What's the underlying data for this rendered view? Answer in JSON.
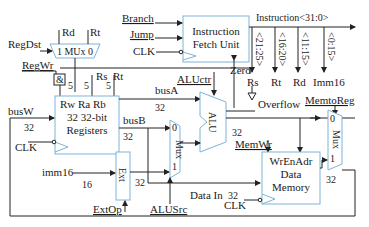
{
  "diagram": {
    "type": "single-cycle MIPS datapath",
    "blocks": {
      "ifu": {
        "line1": "Instruction",
        "line2": "Fetch Unit"
      },
      "regdst_mux": {
        "label": "1 MUx 0"
      },
      "registers": {
        "ports": "Rw  Ra Rb",
        "line1": "32 32-bit",
        "line2": "Registers"
      },
      "alu": {
        "label": "ALU"
      },
      "alusrc_mux": {
        "label": "Mux",
        "in0": "0",
        "in1": "1"
      },
      "ext": {
        "label": "Ext"
      },
      "data_memory": {
        "line1": "WrEnAdr",
        "line2": "Data",
        "line3": "Memory"
      },
      "memtoreg_mux": {
        "label": "Mux",
        "in0": "0",
        "in1": "1"
      },
      "and_gate": {
        "label": "&"
      }
    },
    "control_signals": {
      "branch": "Branch",
      "jump": "Jump",
      "regdst": "RegDst",
      "regwr": "RegWr",
      "aluctr": "ALUctr",
      "memwr": "MemWr",
      "memtoreg": "MemtoReg",
      "alusrc": "ALUSrc",
      "extop": "ExtOp"
    },
    "signals": {
      "clk": "CLK",
      "instruction": "Instruction<31:0>",
      "field_rs": "<21:25>",
      "field_rt": "<16:20>",
      "field_rd": "<11:15>",
      "field_imm": "<0:15>",
      "rs": "Rs",
      "rt": "Rt",
      "rd": "Rd",
      "imm16_top": "Imm16",
      "imm16": "imm16",
      "zero": "Zero",
      "overflow": "Overflow",
      "busA": "busA",
      "busB": "busB",
      "busW": "busW",
      "data_in": "Data In",
      "mux_rd": "Rd",
      "mux_rt": "Rt",
      "reg_rs": "Rs",
      "reg_rt": "Rt"
    },
    "widths": {
      "w5": "5",
      "w16": "16",
      "w32": "32"
    }
  }
}
